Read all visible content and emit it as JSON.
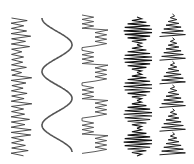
{
  "canvas": {
    "width": 194,
    "height": 164,
    "background": "#ffffff"
  },
  "patterns": [
    {
      "name": "jagged-zigzag",
      "kind": "jagged",
      "x": 10,
      "w": 22,
      "y0": 18,
      "y1": 156,
      "step": 2.6,
      "color": "#3a3a3a",
      "stroke": 0.9
    },
    {
      "name": "sine-wave",
      "kind": "sine",
      "x": 42,
      "w": 30,
      "y0": 18,
      "y1": 152,
      "periods": 2.5,
      "color": "#555555",
      "stroke": 1.6
    },
    {
      "name": "stepped-zigzag",
      "kind": "stepped",
      "x": 82,
      "w": 26,
      "y0": 15,
      "y1": 156,
      "blocks": 8,
      "color": "#4a4a4a",
      "stroke": 0.9
    },
    {
      "name": "beaded-coils",
      "kind": "beads",
      "x": 124,
      "w": 28,
      "y0": 17,
      "y1": 156,
      "count": 5,
      "color": "#111111",
      "stroke": 1.1
    },
    {
      "name": "triangle-coils",
      "kind": "trees",
      "x": 160,
      "w": 26,
      "y0": 14,
      "y1": 156,
      "count": 6,
      "color": "#222222",
      "stroke": 1.0
    }
  ]
}
